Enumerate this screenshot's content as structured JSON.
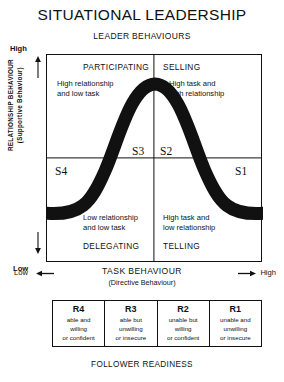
{
  "title": "SITUATIONAL LEADERSHIP",
  "top_caption": "LEADER BEHAVIOURS",
  "bottom_caption": "FOLLOWER READINESS",
  "y_axis": {
    "label_main": "RELATIONSHIP BEHAVIOUR",
    "label_sub": "(Supportive Behaviour)",
    "high": "High",
    "low": "Low",
    "arrow_up": "up-arrow-icon",
    "arrow_down": "down-arrow-icon"
  },
  "x_axis": {
    "label_main": "TASK BEHAVIOUR",
    "label_sub": "(Directive Behaviour)",
    "low": "Low",
    "high": "High",
    "arrow_left": "left-arrow-icon",
    "arrow_right": "right-arrow-icon"
  },
  "quadrants": [
    {
      "code": "S3",
      "style": "PARTICIPATING",
      "description": "High relationship\nand low task",
      "position": "top-left"
    },
    {
      "code": "S2",
      "style": "SELLING",
      "description": "High task and\nhigh relationship",
      "position": "top-right"
    },
    {
      "code": "S4",
      "style": "DELEGATING",
      "description": "Low relationship\nand low task",
      "position": "bottom-left"
    },
    {
      "code": "S1",
      "style": "TELLING",
      "description": "High task and\nlow relationship",
      "position": "bottom-right"
    }
  ],
  "readiness": [
    {
      "code": "R4",
      "description": "able and\nwilling\nor confident"
    },
    {
      "code": "R3",
      "description": "able but\nunwilling\nor insecure"
    },
    {
      "code": "R2",
      "description": "unable but\nwilling\nor confident"
    },
    {
      "code": "R1",
      "description": "unable and\nunwilling\nor insecure"
    }
  ],
  "curve": {
    "name": "bell-curve",
    "color": "#111111",
    "stroke_width": 13
  },
  "colors": {
    "ink": "#111111",
    "background": "#ffffff"
  }
}
